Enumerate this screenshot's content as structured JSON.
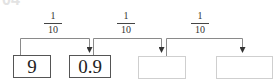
{
  "problem_label": "04",
  "operations": [
    {
      "numerator": "1",
      "denominator": "10"
    },
    {
      "numerator": "1",
      "denominator": "10"
    },
    {
      "numerator": "1",
      "denominator": "10"
    }
  ],
  "boxes": [
    {
      "value": "9"
    },
    {
      "value": "0.9"
    },
    {
      "value": ""
    },
    {
      "value": ""
    }
  ],
  "colors": {
    "filled_border": "#555555",
    "empty_border": "#cfcfcf",
    "line": "#777777"
  }
}
